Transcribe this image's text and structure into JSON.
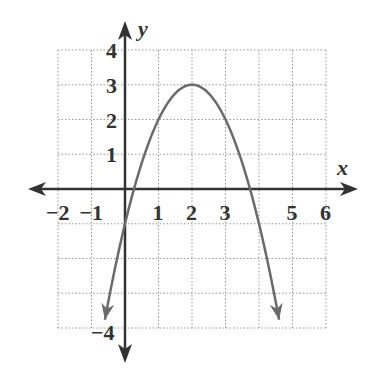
{
  "chart_data": {
    "type": "line",
    "title": "",
    "xlabel": "x",
    "ylabel": "y",
    "xlim": [
      -2,
      6
    ],
    "ylim": [
      -4,
      4
    ],
    "grid": true,
    "grid_style": "dotted",
    "x_ticks": [
      "−2",
      "−1",
      "1",
      "2",
      "3",
      "5",
      "6"
    ],
    "x_tick_values": [
      -2,
      -1,
      1,
      2,
      3,
      5,
      6
    ],
    "y_ticks": [
      "4",
      "3",
      "2",
      "1",
      "−4"
    ],
    "y_tick_values": [
      4,
      3,
      2,
      1,
      -4
    ],
    "series": [
      {
        "name": "parabola",
        "equation": "y = -(x - 2)^2 + 3",
        "vertex": [
          2,
          3
        ],
        "x_intercepts": [
          0.27,
          3.73
        ],
        "y_intercept": -1,
        "domain_shown": [
          -0.6,
          4.6
        ],
        "arrows_at_ends": true,
        "color": "#6b6b6b",
        "points": [
          {
            "x": -0.6,
            "y": -3.76
          },
          {
            "x": 0,
            "y": -1
          },
          {
            "x": 1,
            "y": 2
          },
          {
            "x": 2,
            "y": 3
          },
          {
            "x": 3,
            "y": 2
          },
          {
            "x": 4,
            "y": -1
          },
          {
            "x": 4.6,
            "y": -3.76
          }
        ]
      }
    ],
    "colors": {
      "axis": "#333333",
      "grid": "#999999",
      "curve": "#6b6b6b"
    }
  }
}
